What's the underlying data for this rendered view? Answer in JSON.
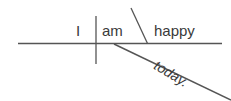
{
  "diagram": {
    "type": "reed-kellogg-sentence-diagram",
    "sentence": "I am happy today.",
    "background_color": "#ffffff",
    "line_color": "#555555",
    "text_color": "#3a3a3a",
    "words": {
      "subject": "I",
      "verb": "am",
      "complement": "happy",
      "modifier": "today."
    },
    "lines": {
      "baseline_label": "horizontal-baseline",
      "subject_verb_divider_label": "subject-verb-divider",
      "complement_divider_label": "predicate-complement-slant",
      "modifier_line_label": "adverb-modifier-diagonal"
    }
  }
}
